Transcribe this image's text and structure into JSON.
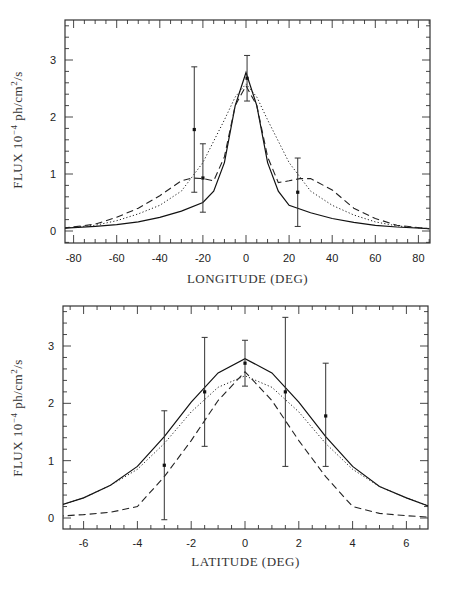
{
  "chart_data": [
    {
      "type": "line",
      "title": "",
      "xlabel": "LONGITUDE (DEG)",
      "ylabel": "FLUX 10^-4 ph/cm^2/s",
      "xlim": [
        -85,
        85
      ],
      "ylim": [
        -0.2,
        3.7
      ],
      "xticks": [
        -80,
        -60,
        -40,
        -20,
        0,
        20,
        40,
        60,
        80
      ],
      "yticks": [
        0,
        1,
        2,
        3
      ],
      "grid": false,
      "legend": null,
      "series": [
        {
          "name": "model-solid",
          "style": "solid",
          "x": [
            -85,
            -70,
            -60,
            -50,
            -40,
            -30,
            -20,
            -15,
            -10,
            -5,
            0,
            5,
            10,
            15,
            20,
            30,
            40,
            50,
            60,
            70,
            85
          ],
          "y": [
            0.05,
            0.08,
            0.11,
            0.16,
            0.24,
            0.35,
            0.5,
            0.7,
            1.2,
            2.2,
            2.78,
            2.2,
            1.2,
            0.7,
            0.45,
            0.32,
            0.22,
            0.15,
            0.1,
            0.07,
            0.04
          ]
        },
        {
          "name": "model-dotted",
          "style": "dotted",
          "x": [
            -85,
            -70,
            -60,
            -50,
            -40,
            -30,
            -20,
            -10,
            -5,
            0,
            5,
            10,
            20,
            30,
            40,
            50,
            60,
            70,
            85
          ],
          "y": [
            0.05,
            0.1,
            0.18,
            0.3,
            0.45,
            0.7,
            1.2,
            1.95,
            2.35,
            2.58,
            2.35,
            1.95,
            1.2,
            0.7,
            0.45,
            0.28,
            0.16,
            0.09,
            0.04
          ]
        },
        {
          "name": "model-dashed",
          "style": "dashed",
          "x": [
            -85,
            -70,
            -60,
            -50,
            -40,
            -30,
            -25,
            -20,
            -15,
            -10,
            -5,
            0,
            5,
            10,
            15,
            20,
            25,
            30,
            40,
            50,
            60,
            70,
            85
          ],
          "y": [
            0.05,
            0.12,
            0.24,
            0.4,
            0.62,
            0.88,
            0.93,
            0.92,
            0.88,
            1.3,
            2.2,
            2.55,
            2.2,
            1.3,
            0.85,
            0.88,
            0.92,
            0.92,
            0.72,
            0.4,
            0.22,
            0.1,
            0.04
          ]
        }
      ],
      "points": [
        {
          "x": -24,
          "y": 1.78,
          "ylow": 0.68,
          "yhigh": 2.88
        },
        {
          "x": -20,
          "y": 0.93,
          "ylow": 0.33,
          "yhigh": 1.53
        },
        {
          "x": 0.5,
          "y": 2.68,
          "ylow": 2.28,
          "yhigh": 3.08
        },
        {
          "x": 24,
          "y": 0.68,
          "ylow": 0.08,
          "yhigh": 1.28
        }
      ]
    },
    {
      "type": "line",
      "title": "",
      "xlabel": "LATITUDE (DEG)",
      "ylabel": "FLUX 10^-4 ph/cm^2/s",
      "xlim": [
        -7,
        7
      ],
      "ylim": [
        -0.2,
        3.7
      ],
      "xticks": [
        -6,
        -4,
        -2,
        0,
        2,
        4,
        6
      ],
      "yticks": [
        0,
        1,
        2,
        3
      ],
      "grid": false,
      "legend": null,
      "series": [
        {
          "name": "model-solid",
          "style": "solid",
          "x": [
            -7,
            -6,
            -5,
            -4,
            -3,
            -2,
            -1,
            0,
            1,
            2,
            3,
            4,
            5,
            6,
            7
          ],
          "y": [
            0.2,
            0.35,
            0.57,
            0.9,
            1.42,
            2.02,
            2.53,
            2.78,
            2.53,
            2.02,
            1.42,
            0.9,
            0.55,
            0.35,
            0.18
          ]
        },
        {
          "name": "model-dotted",
          "style": "dotted",
          "x": [
            -7,
            -6,
            -5,
            -4,
            -3,
            -2,
            -1,
            0,
            1,
            2,
            3,
            4,
            5,
            6,
            7
          ],
          "y": [
            0.2,
            0.35,
            0.57,
            0.85,
            1.3,
            1.85,
            2.28,
            2.48,
            2.28,
            1.85,
            1.3,
            0.85,
            0.55,
            0.35,
            0.18
          ]
        },
        {
          "name": "model-dashed",
          "style": "dashed",
          "x": [
            -7,
            -6,
            -5,
            -4,
            -3,
            -2,
            -1,
            0,
            1,
            2,
            3,
            4,
            5,
            6,
            7
          ],
          "y": [
            0.03,
            0.06,
            0.1,
            0.2,
            0.72,
            1.35,
            2.05,
            2.55,
            2.05,
            1.35,
            0.72,
            0.2,
            0.08,
            0.04,
            0.01
          ]
        }
      ],
      "points": [
        {
          "x": -3,
          "y": 0.92,
          "ylow": -0.03,
          "yhigh": 1.87
        },
        {
          "x": -1.5,
          "y": 2.2,
          "ylow": 1.25,
          "yhigh": 3.15
        },
        {
          "x": 0,
          "y": 2.7,
          "ylow": 2.3,
          "yhigh": 3.1
        },
        {
          "x": 1.5,
          "y": 2.2,
          "ylow": 0.9,
          "yhigh": 3.5
        },
        {
          "x": 3,
          "y": 1.78,
          "ylow": 0.9,
          "yhigh": 2.7
        }
      ]
    }
  ],
  "labels": {
    "top_xlabel": "LONGITUDE (DEG)",
    "bottom_xlabel": "LATITUDE (DEG)",
    "ylabel_prefix": "FLUX 10",
    "ylabel_exp": "−4",
    "ylabel_unit": " ph/cm",
    "ylabel_unit_exp": "2",
    "ylabel_suffix": "/s"
  }
}
